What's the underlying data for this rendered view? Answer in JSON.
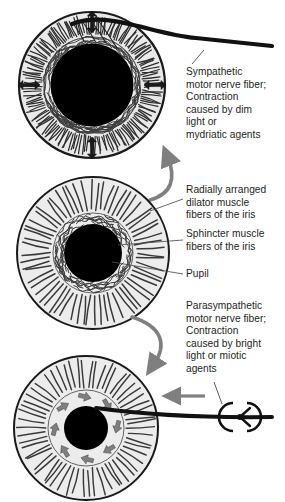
{
  "figure": {
    "background_color": "#ffffff",
    "ink_color": "#231f20",
    "iris_fill": "#e8e8e8",
    "pupil_fill": "#000000",
    "arrow_gray": "#7f7f7f",
    "fiber_gray": "#4a4a4a"
  },
  "labels": {
    "sympathetic": "Sympathetic\nmotor nerve fiber;\nContraction\ncaused by dim\nlight or\nmydriatic agents",
    "dilator": "Radially arranged\ndilator muscle\nfibers of the iris",
    "sphincter": "Sphincter muscle\nfibers of the iris",
    "pupil": "Pupil",
    "parasympathetic": "Parasympathetic\nmotor nerve fiber;\nContraction\ncaused by bright\nlight or miotic\nagents"
  },
  "diagrams": [
    {
      "name": "dilated-eye",
      "state": "dilated",
      "pupil_size": "large",
      "center": [
        92,
        85
      ],
      "iris_radius": 73,
      "pupil_radius": 41,
      "arrow_count": 4,
      "arrow_type": "radial-double-headed",
      "has_nerve_fiber": true,
      "nerve_type": "sympathetic"
    },
    {
      "name": "neutral-eye",
      "state": "neutral",
      "pupil_size": "medium",
      "center": [
        93,
        253
      ],
      "iris_radius": 76,
      "pupil_radius": 29,
      "arrow_count": 0,
      "arrow_type": "none",
      "has_nerve_fiber": false,
      "nerve_type": "none"
    },
    {
      "name": "constricted-eye",
      "state": "constricted",
      "pupil_size": "small",
      "center": [
        86,
        428
      ],
      "iris_radius": 73,
      "pupil_radius": 22,
      "arrow_count": 8,
      "arrow_type": "circular-inward",
      "has_nerve_fiber": true,
      "nerve_type": "parasympathetic"
    }
  ],
  "transition_arrows": [
    {
      "name": "constrict-to-dilate-arrow",
      "direction": "up",
      "color": "#7f7f7f"
    },
    {
      "name": "dilate-to-constrict-arrow",
      "direction": "down",
      "color": "#7f7f7f"
    }
  ],
  "nerve_elements": [
    {
      "name": "sympathetic-nerve-fiber",
      "shape": "curved-thick-line"
    },
    {
      "name": "parasympathetic-nerve-fiber",
      "shape": "straight-thick-line"
    },
    {
      "name": "ciliary-ganglion",
      "shape": "broken-circle-with-y-node"
    },
    {
      "name": "signal-direction-arrow",
      "direction": "left",
      "color": "#7f7f7f"
    }
  ]
}
